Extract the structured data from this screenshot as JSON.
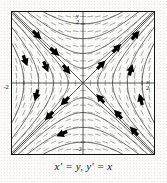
{
  "figure": {
    "caption": "x′ = y,  y′ = x",
    "axes": {
      "x_axis_label": "x",
      "y_axis_label": "y",
      "x_right_tick": "2",
      "x_left_tick": "-2",
      "y_top_tick": "2",
      "y_bottom_tick": "-2"
    },
    "colors": {
      "frame": "#111111",
      "axis": "#3a3a3a",
      "trajectory": "#5a5a5a",
      "arrow": "#000000",
      "dash_field": "#777777",
      "background": "#fdfdfc",
      "page": "#fbfaf8"
    }
  },
  "chart_data": {
    "type": "line",
    "title": "",
    "subtitle": "",
    "xlabel": "x",
    "ylabel": "y",
    "xlim": [
      -2.4,
      2.4
    ],
    "ylim": [
      -2.4,
      2.4
    ],
    "xticks": [
      -2,
      2
    ],
    "xticklabels": [
      "-2",
      "2"
    ],
    "yticks": [
      -2,
      2
    ],
    "yticklabels": [
      "-2",
      "2"
    ],
    "grid": false,
    "legend": null,
    "annotations": [
      "x′ = y,  y′ = x"
    ],
    "system": {
      "equations": [
        "x' = y",
        "y' = x"
      ],
      "equilibrium": [
        0,
        0
      ],
      "equilibrium_type": "saddle",
      "eigenvalues": [
        1,
        -1
      ],
      "eigenvectors": [
        [
          1,
          1
        ],
        [
          1,
          -1
        ]
      ],
      "separatrices": [
        "y = x",
        "y = -x"
      ]
    },
    "series": [
      {
        "name": "separatrix y=x (unstable)",
        "c": 0,
        "branch": "line"
      },
      {
        "name": "separatrix y=-x (stable)",
        "c": 0,
        "branch": "line"
      },
      {
        "name": "hyperbola x^2-y^2=0.25",
        "c": 0.25
      },
      {
        "name": "hyperbola x^2-y^2=1.0",
        "c": 1.0
      },
      {
        "name": "hyperbola x^2-y^2=2.25",
        "c": 2.25
      },
      {
        "name": "hyperbola x^2-y^2=4.0",
        "c": 4.0
      },
      {
        "name": "hyperbola x^2-y^2=-0.25",
        "c": -0.25
      },
      {
        "name": "hyperbola x^2-y^2=-1.0",
        "c": -1.0
      },
      {
        "name": "hyperbola x^2-y^2=-2.25",
        "c": -2.25
      },
      {
        "name": "hyperbola x^2-y^2=-4.0",
        "c": -4.0
      }
    ],
    "arrows": [
      {
        "x": -1.55,
        "y": 1.62,
        "dx": 1.62,
        "dy": -1.55,
        "quadrant": "top-left"
      },
      {
        "x": -0.95,
        "y": 1.05,
        "dx": 1.05,
        "dy": -0.95,
        "quadrant": "top-left"
      },
      {
        "x": -1.95,
        "y": 0.75,
        "dx": 0.75,
        "dy": -1.95,
        "quadrant": "top-left"
      },
      {
        "x": -1.25,
        "y": 0.55,
        "dx": 0.55,
        "dy": -1.25,
        "quadrant": "top-left"
      },
      {
        "x": -0.55,
        "y": 0.45,
        "dx": 0.45,
        "dy": -0.55,
        "quadrant": "top-left"
      },
      {
        "x": 0.62,
        "y": 0.62,
        "dx": 0.62,
        "dy": 0.62,
        "quadrant": "top-right"
      },
      {
        "x": 1.15,
        "y": 1.18,
        "dx": 1.18,
        "dy": 1.15,
        "quadrant": "top-right"
      },
      {
        "x": 1.78,
        "y": 1.62,
        "dx": 1.62,
        "dy": 1.78,
        "quadrant": "top-right"
      },
      {
        "x": 1.62,
        "y": 0.45,
        "dx": 0.45,
        "dy": 1.62,
        "quadrant": "top-right"
      },
      {
        "x": -0.62,
        "y": -0.62,
        "dx": -0.62,
        "dy": -0.62,
        "quadrant": "bottom-left"
      },
      {
        "x": -1.15,
        "y": -1.12,
        "dx": -1.12,
        "dy": -1.15,
        "quadrant": "bottom-left"
      },
      {
        "x": -1.58,
        "y": -0.42,
        "dx": -0.42,
        "dy": -1.58,
        "quadrant": "bottom-left"
      },
      {
        "x": -0.72,
        "y": -1.72,
        "dx": -1.72,
        "dy": -0.72,
        "quadrant": "bottom-left"
      },
      {
        "x": 0.58,
        "y": -0.52,
        "dx": -0.52,
        "dy": 0.58,
        "quadrant": "bottom-right"
      },
      {
        "x": 1.18,
        "y": -1.05,
        "dx": -1.05,
        "dy": 1.18,
        "quadrant": "bottom-right"
      },
      {
        "x": 1.72,
        "y": -1.62,
        "dx": -1.62,
        "dy": 1.72,
        "quadrant": "bottom-right"
      },
      {
        "x": 1.95,
        "y": -0.55,
        "dx": -0.55,
        "dy": 1.95,
        "quadrant": "bottom-right"
      }
    ]
  }
}
